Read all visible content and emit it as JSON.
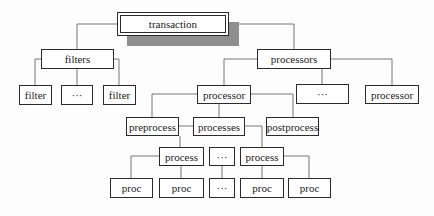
{
  "diagram": {
    "type": "tree",
    "line_color": "#777777",
    "shadow_color": "#8e8e8e",
    "root": {
      "id": "transaction",
      "label": "transaction",
      "x": 117,
      "y": 12,
      "w": 112,
      "h": 24
    },
    "nodes": [
      {
        "id": "filters",
        "label": "filters",
        "x": 41,
        "y": 49,
        "w": 73,
        "h": 20
      },
      {
        "id": "filter1",
        "label": "filter",
        "x": 19,
        "y": 85,
        "w": 33,
        "h": 20
      },
      {
        "id": "filter-ellipsis",
        "label": "···",
        "x": 61,
        "y": 85,
        "w": 32,
        "h": 20
      },
      {
        "id": "filter2",
        "label": "filter",
        "x": 103,
        "y": 85,
        "w": 33,
        "h": 20
      },
      {
        "id": "processors",
        "label": "processors",
        "x": 257,
        "y": 49,
        "w": 74,
        "h": 20
      },
      {
        "id": "processor1",
        "label": "processor",
        "x": 197,
        "y": 85,
        "w": 54,
        "h": 19
      },
      {
        "id": "processor-ellipsis",
        "label": "···",
        "x": 296,
        "y": 84,
        "w": 53,
        "h": 20
      },
      {
        "id": "processor2",
        "label": "processor",
        "x": 365,
        "y": 85,
        "w": 54,
        "h": 19
      },
      {
        "id": "preprocess",
        "label": "preprocess",
        "x": 126,
        "y": 117,
        "w": 53,
        "h": 19
      },
      {
        "id": "processes",
        "label": "processes",
        "x": 193,
        "y": 117,
        "w": 52,
        "h": 19
      },
      {
        "id": "postprocess",
        "label": "postprocess",
        "x": 266,
        "y": 117,
        "w": 53,
        "h": 19
      },
      {
        "id": "process1",
        "label": "process",
        "x": 159,
        "y": 147,
        "w": 45,
        "h": 19
      },
      {
        "id": "process-ellipsis",
        "label": "···",
        "x": 209,
        "y": 147,
        "w": 26,
        "h": 19
      },
      {
        "id": "process2",
        "label": "process",
        "x": 240,
        "y": 147,
        "w": 44,
        "h": 19
      },
      {
        "id": "proc1",
        "label": "proc",
        "x": 110,
        "y": 178,
        "w": 43,
        "h": 20
      },
      {
        "id": "proc2",
        "label": "proc",
        "x": 159,
        "y": 178,
        "w": 45,
        "h": 20
      },
      {
        "id": "proc-ellipsis",
        "label": "···",
        "x": 209,
        "y": 178,
        "w": 26,
        "h": 20
      },
      {
        "id": "proc3",
        "label": "proc",
        "x": 240,
        "y": 178,
        "w": 44,
        "h": 20
      },
      {
        "id": "proc4",
        "label": "proc",
        "x": 288,
        "y": 178,
        "w": 43,
        "h": 20
      }
    ]
  }
}
